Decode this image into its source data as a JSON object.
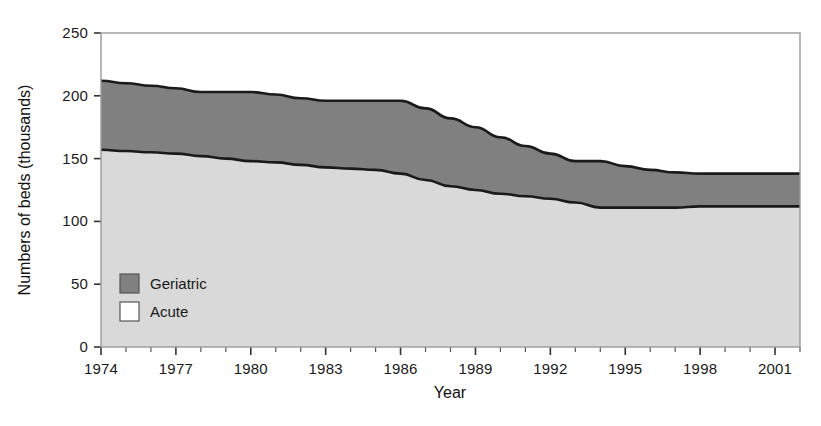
{
  "chart_data": {
    "type": "area",
    "title": "",
    "subtitle": "",
    "xlabel": "Year",
    "ylabel": "Numbers of beds (thousands)",
    "stacked": true,
    "grid": false,
    "legend_position": "inside-bottom-left",
    "xlim": [
      1974,
      2001
    ],
    "ylim": [
      0,
      250
    ],
    "yticks": [
      0,
      50,
      100,
      150,
      200,
      250
    ],
    "ytick_labels": [
      "0",
      "50",
      "100",
      "150",
      "200",
      "250"
    ],
    "xticks": [
      1974,
      1977,
      1980,
      1983,
      1986,
      1989,
      1992,
      1995,
      1998,
      2001
    ],
    "xtick_labels": [
      "1974",
      "1977",
      "1980",
      "1983",
      "1986",
      "1989",
      "1992",
      "1995",
      "1998",
      "2001"
    ],
    "x_minor_tick_interval": 1,
    "x": [
      1974,
      1975,
      1976,
      1977,
      1978,
      1979,
      1980,
      1981,
      1982,
      1983,
      1984,
      1985,
      1986,
      1987,
      1988,
      1989,
      1990,
      1991,
      1992,
      1993,
      1994,
      1995,
      1996,
      1997,
      1998,
      1999,
      2000,
      2001,
      2002
    ],
    "series": [
      {
        "name": "Acute",
        "color": "#d9d9d9",
        "border_color": "#1a1a1a",
        "values": [
          157,
          156,
          155,
          154,
          152,
          150,
          148,
          147,
          145,
          143,
          142,
          141,
          138,
          133,
          128,
          125,
          122,
          120,
          118,
          115,
          111,
          111,
          111,
          111,
          112,
          112,
          112,
          112,
          112
        ]
      },
      {
        "name": "Geriatric",
        "color": "#808080",
        "border_color": "#1a1a1a",
        "values": [
          55,
          54,
          53,
          52,
          51,
          53,
          55,
          54,
          53,
          53,
          54,
          55,
          58,
          57,
          54,
          50,
          45,
          40,
          36,
          33,
          37,
          33,
          30,
          28,
          26,
          26,
          26,
          26,
          26
        ]
      }
    ],
    "totals": [
      212,
      210,
      208,
      206,
      203,
      203,
      203,
      201,
      198,
      196,
      196,
      196,
      196,
      190,
      182,
      175,
      167,
      160,
      154,
      148,
      148,
      144,
      141,
      139,
      138,
      138,
      138,
      138,
      138
    ],
    "annotations": []
  },
  "legend": {
    "items": [
      {
        "label": "Geriatric",
        "swatch": "#808080"
      },
      {
        "label": "Acute",
        "swatch": "#ffffff"
      }
    ]
  },
  "axes": {
    "y_title": "Numbers of beds (thousands)",
    "x_title": "Year",
    "y_labels": [
      "250",
      "200",
      "150",
      "100",
      "50",
      "0"
    ],
    "x_labels": [
      "1974",
      "1977",
      "1980",
      "1983",
      "1986",
      "1989",
      "1992",
      "1995",
      "1998",
      "2001"
    ]
  },
  "colors": {
    "acute_fill": "#d9d9d9",
    "geriatric_fill": "#808080",
    "line": "#1a1a1a",
    "frame": "#9a9a9a",
    "text": "#1a1a1a",
    "background": "#ffffff"
  }
}
